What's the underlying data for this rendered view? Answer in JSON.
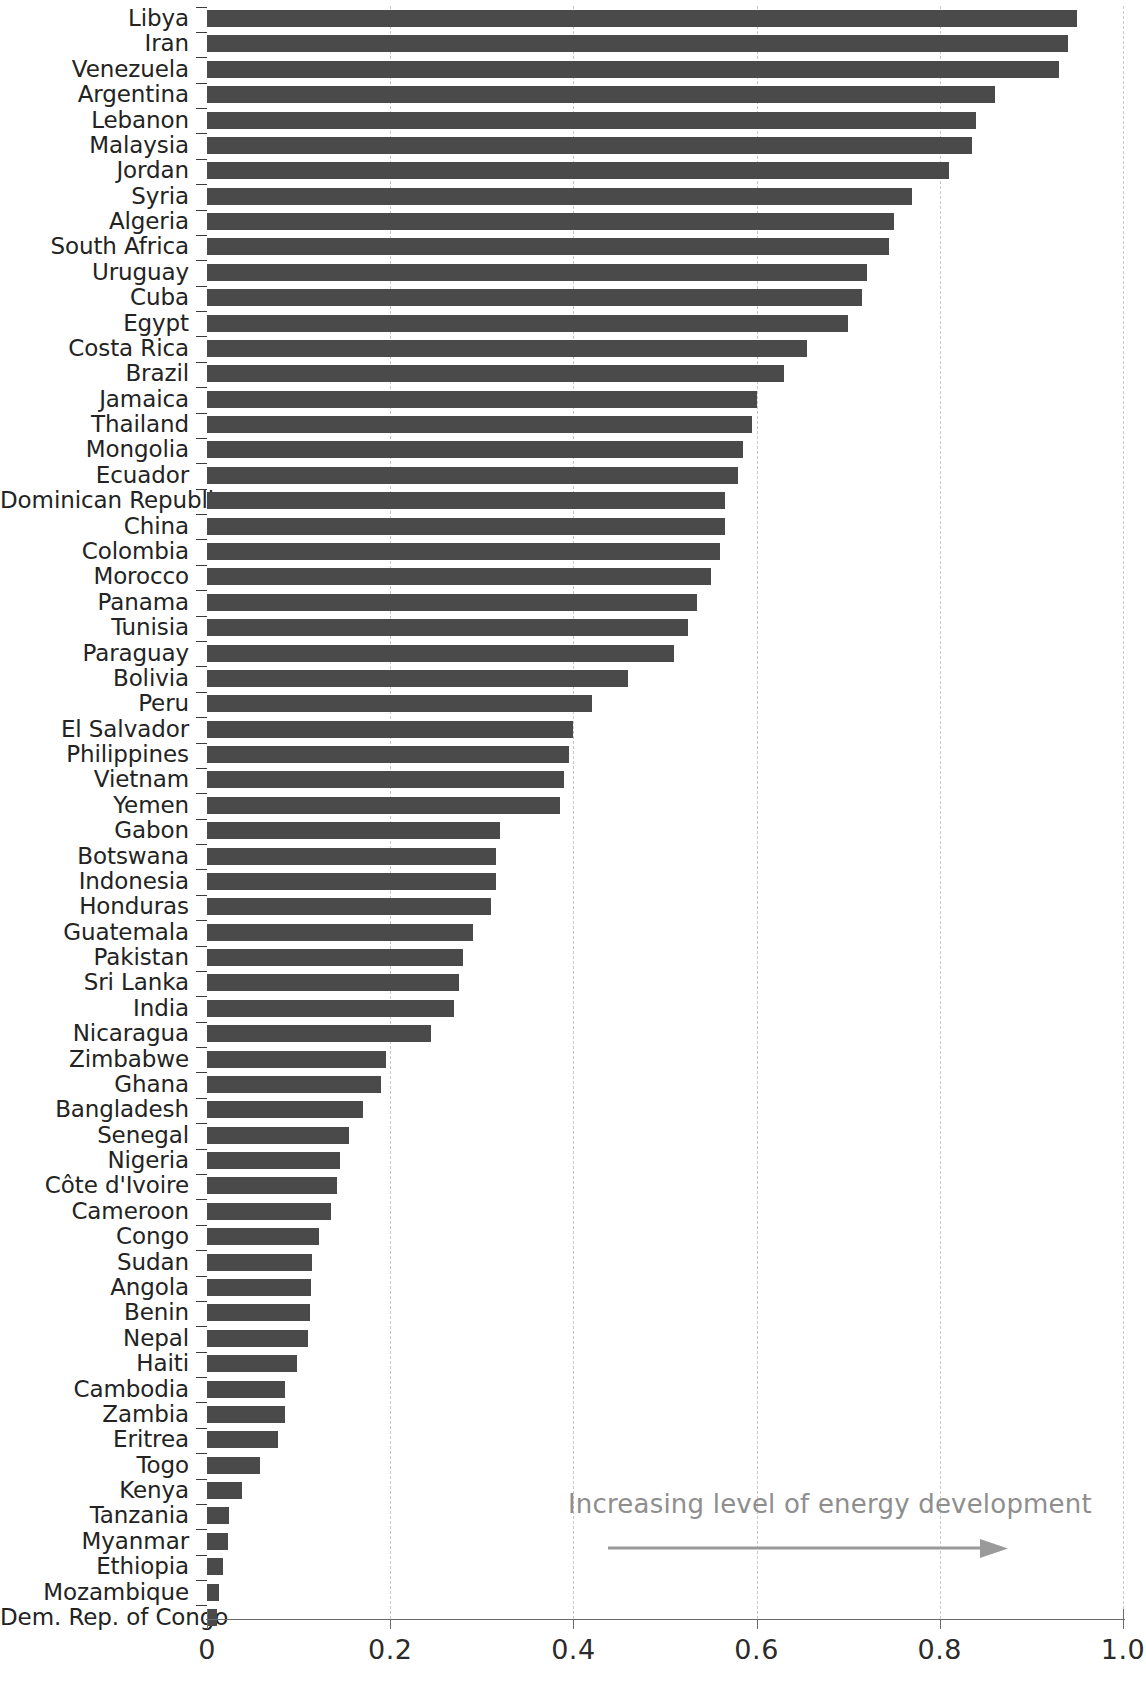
{
  "chart_data": {
    "type": "bar",
    "orientation": "horizontal",
    "title": "",
    "subtitle": "",
    "xlabel": "",
    "ylabel": "",
    "xlim": [
      0,
      1.0
    ],
    "xticks": [
      "0",
      "0.2",
      "0.4",
      "0.6",
      "0.8",
      "1.0"
    ],
    "xtick_values": [
      0,
      0.2,
      0.4,
      0.6,
      0.8,
      1.0
    ],
    "gridlines": [
      "0.2",
      "0.4",
      "0.6",
      "0.8",
      "1.0"
    ],
    "grid": true,
    "legend": null,
    "bar_color": "#4a4a4a",
    "annotations": [
      {
        "text": "Increasing level of energy development",
        "arrow": "right-arrow",
        "color": "#8e8e8e"
      }
    ],
    "categories": [
      "Libya",
      "Iran",
      "Venezuela",
      "Argentina",
      "Lebanon",
      "Malaysia",
      "Jordan",
      "Syria",
      "Algeria",
      "South Africa",
      "Uruguay",
      "Cuba",
      "Egypt",
      "Costa Rica",
      "Brazil",
      "Jamaica",
      "Thailand",
      "Mongolia",
      "Ecuador",
      "Dominican Republic",
      "China",
      "Colombia",
      "Morocco",
      "Panama",
      "Tunisia",
      "Paraguay",
      "Bolivia",
      "Peru",
      "El Salvador",
      "Philippines",
      "Vietnam",
      "Yemen",
      "Gabon",
      "Botswana",
      "Indonesia",
      "Honduras",
      "Guatemala",
      "Pakistan",
      "Sri Lanka",
      "India",
      "Nicaragua",
      "Zimbabwe",
      "Ghana",
      "Bangladesh",
      "Senegal",
      "Nigeria",
      "Côte d'Ivoire",
      "Cameroon",
      "Congo",
      "Sudan",
      "Angola",
      "Benin",
      "Nepal",
      "Haiti",
      "Cambodia",
      "Zambia",
      "Eritrea",
      "Togo",
      "Kenya",
      "Tanzania",
      "Myanmar",
      "Ethiopia",
      "Mozambique",
      "Dem. Rep. of Congo"
    ],
    "values": [
      0.95,
      0.94,
      0.93,
      0.86,
      0.84,
      0.835,
      0.81,
      0.77,
      0.75,
      0.745,
      0.72,
      0.715,
      0.7,
      0.655,
      0.63,
      0.6,
      0.595,
      0.585,
      0.58,
      0.565,
      0.565,
      0.56,
      0.55,
      0.535,
      0.525,
      0.51,
      0.46,
      0.42,
      0.4,
      0.395,
      0.39,
      0.385,
      0.32,
      0.315,
      0.315,
      0.31,
      0.29,
      0.28,
      0.275,
      0.27,
      0.245,
      0.195,
      0.19,
      0.17,
      0.155,
      0.145,
      0.142,
      0.135,
      0.122,
      0.115,
      0.113,
      0.112,
      0.11,
      0.098,
      0.085,
      0.085,
      0.078,
      0.058,
      0.038,
      0.024,
      0.023,
      0.018,
      0.013,
      0.011
    ]
  }
}
